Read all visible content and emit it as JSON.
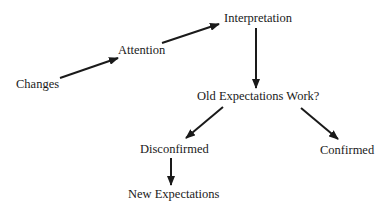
{
  "diagram": {
    "type": "flowchart",
    "nodes": {
      "changes": {
        "label": "Changes"
      },
      "attention": {
        "label": "Attention"
      },
      "interpretation": {
        "label": "Interpretation"
      },
      "old_expectations": {
        "label": "Old Expectations Work?"
      },
      "disconfirmed": {
        "label": "Disconfirmed"
      },
      "confirmed": {
        "label": "Confirmed"
      },
      "new_expectations": {
        "label": "New Expectations"
      }
    },
    "edges": [
      {
        "from": "Changes",
        "to": "Attention"
      },
      {
        "from": "Attention",
        "to": "Interpretation"
      },
      {
        "from": "Interpretation",
        "to": "Old Expectations Work?"
      },
      {
        "from": "Old Expectations Work?",
        "to": "Disconfirmed"
      },
      {
        "from": "Old Expectations Work?",
        "to": "Confirmed"
      },
      {
        "from": "Disconfirmed",
        "to": "New Expectations"
      }
    ],
    "colors": {
      "line": "#1a1a1a",
      "text": "#1a1a1a",
      "background": "#ffffff"
    }
  }
}
